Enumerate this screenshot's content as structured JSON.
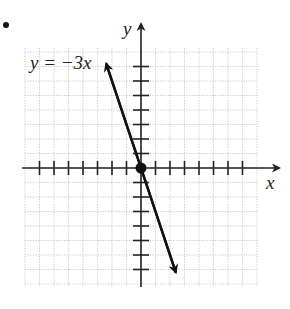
{
  "chart_data": {
    "type": "line",
    "title": "",
    "equation_label": "y = −3x",
    "xlabel": "x",
    "ylabel": "y",
    "xlim": [
      -8,
      8
    ],
    "ylim": [
      -8,
      8
    ],
    "grid": true,
    "tick_spacing": 1,
    "series": [
      {
        "name": "y = −3x",
        "slope": -3,
        "intercept": 0,
        "x": [
          -2.4,
          0,
          2.4
        ],
        "y": [
          7.2,
          0,
          -7.2
        ],
        "arrows_both_ends": true
      }
    ],
    "points": [
      {
        "x": 0,
        "y": 0,
        "marker": "filled-circle"
      }
    ],
    "legend": null
  },
  "labels": {
    "equation": "y = −3x",
    "x_axis": "x",
    "y_axis": "y"
  },
  "colors": {
    "axis": "#222222",
    "line": "#111111",
    "grid": "#bdbdbd",
    "background": "#ffffff"
  }
}
